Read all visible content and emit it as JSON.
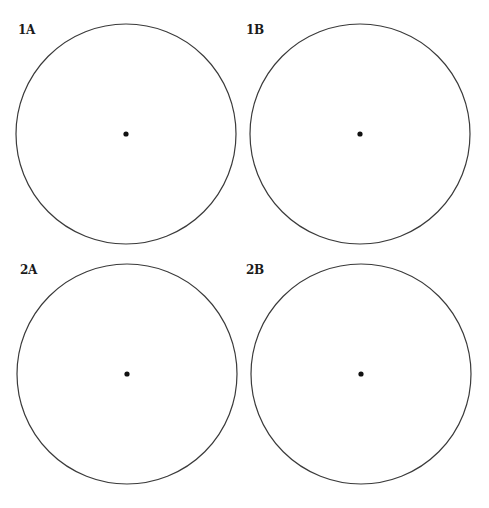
{
  "figure": {
    "stroke_color": "#3a3a3a",
    "dot_color": "#111111",
    "background": "#ffffff",
    "panels": [
      {
        "id": "1A",
        "label": "1A",
        "cx": 126,
        "cy": 134,
        "r": 110,
        "dot_r": 2.6,
        "label_x": 18,
        "label_y": 24
      },
      {
        "id": "1B",
        "label": "1B",
        "cx": 360,
        "cy": 134,
        "r": 110,
        "dot_r": 2.6,
        "label_x": 246,
        "label_y": 24
      },
      {
        "id": "2A",
        "label": "2A",
        "cx": 127,
        "cy": 374,
        "r": 110,
        "dot_r": 2.6,
        "label_x": 20,
        "label_y": 264
      },
      {
        "id": "2B",
        "label": "2B",
        "cx": 361,
        "cy": 374,
        "r": 110,
        "dot_r": 2.6,
        "label_x": 246,
        "label_y": 264
      }
    ]
  }
}
